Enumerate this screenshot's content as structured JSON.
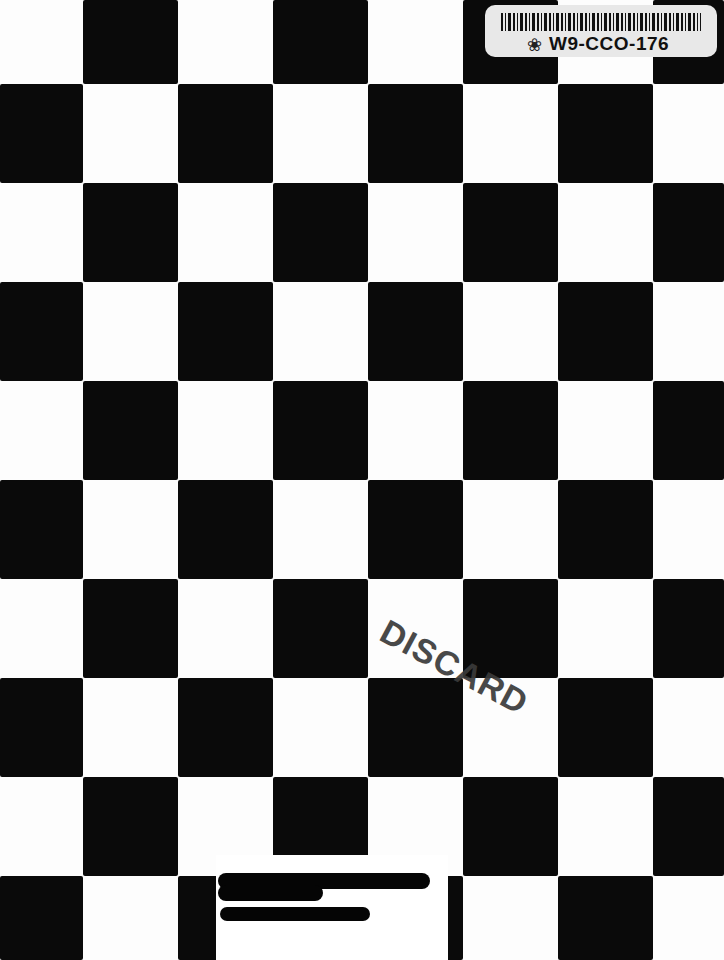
{
  "cover": {
    "pattern": "checkerboard",
    "colors": {
      "dark": "#0a0a0a",
      "light": "#fdfdfd"
    },
    "columns_x": [
      0,
      83,
      178,
      273,
      368,
      463,
      558,
      653,
      724
    ],
    "rows_y": [
      0,
      84,
      183,
      282,
      381,
      480,
      579,
      678,
      777,
      876,
      960
    ]
  },
  "barcode_label": {
    "code": "W9-CCO-176",
    "icon": "leaf-icon"
  },
  "stamp": {
    "text": "DISCARD"
  },
  "library_sticker": {
    "status": "redacted"
  }
}
